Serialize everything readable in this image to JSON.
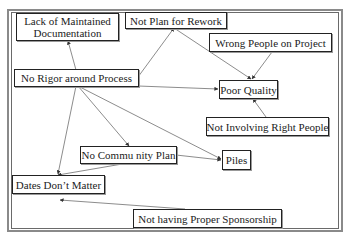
{
  "diagram": {
    "type": "cause-effect network",
    "nodes": [
      {
        "id": "lack_doc",
        "label": "Lack of Maintained Documentation",
        "line1": "Lack of Maintained",
        "line2": "Documentation"
      },
      {
        "id": "not_plan_rework",
        "label": "Not Plan for Rework"
      },
      {
        "id": "wrong_people",
        "label": "Wrong People on Project"
      },
      {
        "id": "no_rigor",
        "label": "No Rigor around Process"
      },
      {
        "id": "poor_quality",
        "label": "Poor Quality"
      },
      {
        "id": "not_involving",
        "label": "Not Involving Right People"
      },
      {
        "id": "no_community_plan",
        "label": "No Commu nity Plan"
      },
      {
        "id": "piles",
        "label": "Piles"
      },
      {
        "id": "dates_dont_matter",
        "label": "Dates Don’t Matter"
      },
      {
        "id": "no_sponsorship",
        "label": "Not having Proper Sponsorship"
      }
    ],
    "edges": [
      {
        "from": "no_rigor",
        "to": "lack_doc"
      },
      {
        "from": "no_rigor",
        "to": "not_plan_rework"
      },
      {
        "from": "no_rigor",
        "to": "poor_quality"
      },
      {
        "from": "no_rigor",
        "to": "no_community_plan"
      },
      {
        "from": "no_rigor",
        "to": "piles"
      },
      {
        "from": "no_rigor",
        "to": "dates_dont_matter"
      },
      {
        "from": "not_plan_rework",
        "to": "poor_quality"
      },
      {
        "from": "wrong_people",
        "to": "poor_quality"
      },
      {
        "from": "not_involving",
        "to": "poor_quality"
      },
      {
        "from": "no_community_plan",
        "to": "piles"
      },
      {
        "from": "no_community_plan",
        "to": "dates_dont_matter"
      },
      {
        "from": "no_sponsorship",
        "to": "dates_dont_matter"
      }
    ]
  },
  "colors": {
    "line": "#6f6f6f",
    "box_border": "#222222",
    "text": "#222222"
  }
}
